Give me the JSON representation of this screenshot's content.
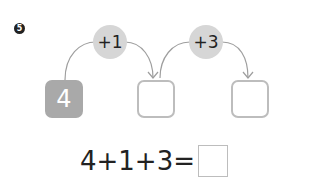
{
  "problem": {
    "number": "5",
    "operations": [
      {
        "label": "+1"
      },
      {
        "label": "+3"
      }
    ],
    "boxes": [
      {
        "value": "4",
        "filled": true
      },
      {
        "value": "",
        "filled": false
      },
      {
        "value": "",
        "filled": false
      }
    ],
    "equation": {
      "expression": "4+1+3=",
      "answer": ""
    }
  },
  "colors": {
    "filled_box": "#a9a9a9",
    "empty_box_border": "#bdbdbd",
    "operation_circle": "#d6d6d6",
    "arrow": "#9e9e9e"
  }
}
